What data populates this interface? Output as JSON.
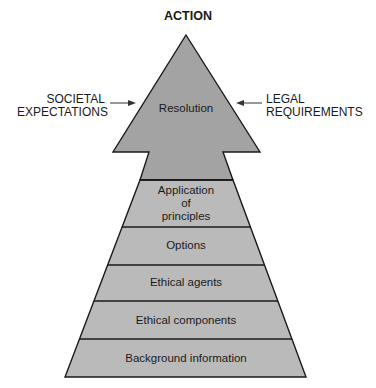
{
  "diagram": {
    "title": "ACTION",
    "left_input": {
      "line1": "SOCIETAL",
      "line2": "EXPECTATIONS"
    },
    "right_input": {
      "line1": "LEGAL",
      "line2": "REQUIREMENTS"
    },
    "arrowhead_label": "Resolution",
    "layers": [
      {
        "label_lines": [
          "Application",
          "of",
          "principles"
        ]
      },
      {
        "label": "Options"
      },
      {
        "label": "Ethical agents"
      },
      {
        "label": "Ethical components"
      },
      {
        "label": "Background information"
      }
    ],
    "colors": {
      "arrowhead_fill": "#a3a3a3",
      "layer_fill": "#bababa",
      "stroke": "#1a1a1a"
    }
  }
}
